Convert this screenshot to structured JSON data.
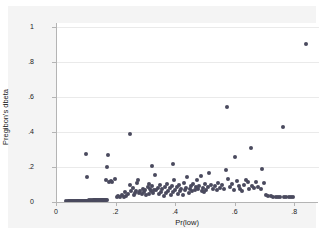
{
  "figure": {
    "background_color": "#f4f4f4",
    "plot_background_color": "#ffffff",
    "marker_color": "#4a4a5e",
    "axis_color": "#b4b4b4",
    "grid_color": "#eaeaea"
  },
  "chart_data": {
    "type": "scatter",
    "title": "",
    "xlabel": "Pr(low)",
    "ylabel": "Pregibon's dbeta",
    "xlim": [
      0,
      0.88
    ],
    "ylim": [
      0,
      1.02
    ],
    "xticks": [
      0,
      0.2,
      0.4,
      0.6,
      0.8
    ],
    "xticklabels": [
      "0",
      ".2",
      ".4",
      ".6",
      ".8"
    ],
    "yticks": [
      0,
      0.2,
      0.4,
      0.6,
      0.8,
      1
    ],
    "yticklabels": [
      "0",
      ".2",
      ".4",
      ".6",
      ".8",
      "1"
    ],
    "grid": "horizontal",
    "legend": null,
    "series": [
      {
        "name": "Pregibon's dbeta",
        "marker": "circle",
        "color": "#4a4a5e",
        "points": [
          [
            0.031,
            0.004
          ],
          [
            0.036,
            0.004
          ],
          [
            0.04,
            0.005
          ],
          [
            0.044,
            0.004
          ],
          [
            0.048,
            0.005
          ],
          [
            0.051,
            0.004
          ],
          [
            0.054,
            0.005
          ],
          [
            0.057,
            0.006
          ],
          [
            0.06,
            0.005
          ],
          [
            0.063,
            0.006
          ],
          [
            0.066,
            0.005
          ],
          [
            0.069,
            0.006
          ],
          [
            0.072,
            0.006
          ],
          [
            0.075,
            0.007
          ],
          [
            0.078,
            0.006
          ],
          [
            0.081,
            0.007
          ],
          [
            0.084,
            0.007
          ],
          [
            0.087,
            0.006
          ],
          [
            0.09,
            0.007
          ],
          [
            0.093,
            0.008
          ],
          [
            0.096,
            0.007
          ],
          [
            0.099,
            0.008
          ],
          [
            0.102,
            0.008
          ],
          [
            0.105,
            0.007
          ],
          [
            0.108,
            0.009
          ],
          [
            0.111,
            0.008
          ],
          [
            0.114,
            0.009
          ],
          [
            0.117,
            0.008
          ],
          [
            0.12,
            0.009
          ],
          [
            0.123,
            0.01
          ],
          [
            0.126,
            0.009
          ],
          [
            0.129,
            0.01
          ],
          [
            0.132,
            0.01
          ],
          [
            0.135,
            0.009
          ],
          [
            0.138,
            0.011
          ],
          [
            0.141,
            0.01
          ],
          [
            0.144,
            0.011
          ],
          [
            0.147,
            0.01
          ],
          [
            0.15,
            0.011
          ],
          [
            0.153,
            0.012
          ],
          [
            0.156,
            0.011
          ],
          [
            0.159,
            0.012
          ],
          [
            0.162,
            0.011
          ],
          [
            0.165,
            0.012
          ],
          [
            0.168,
            0.013
          ],
          [
            0.099,
            0.271
          ],
          [
            0.1,
            0.145
          ],
          [
            0.165,
            0.128
          ],
          [
            0.168,
            0.197
          ],
          [
            0.172,
            0.265
          ],
          [
            0.174,
            0.113
          ],
          [
            0.18,
            0.118
          ],
          [
            0.184,
            0.112
          ],
          [
            0.196,
            0.131
          ],
          [
            0.2,
            0.03
          ],
          [
            0.205,
            0.036
          ],
          [
            0.212,
            0.029
          ],
          [
            0.218,
            0.042
          ],
          [
            0.224,
            0.031
          ],
          [
            0.228,
            0.055
          ],
          [
            0.233,
            0.034
          ],
          [
            0.238,
            0.046
          ],
          [
            0.244,
            0.096
          ],
          [
            0.246,
            0.389
          ],
          [
            0.25,
            0.061
          ],
          [
            0.254,
            0.079
          ],
          [
            0.258,
            0.042
          ],
          [
            0.262,
            0.053
          ],
          [
            0.266,
            0.065
          ],
          [
            0.27,
            0.11
          ],
          [
            0.273,
            0.123
          ],
          [
            0.276,
            0.051
          ],
          [
            0.28,
            0.063
          ],
          [
            0.284,
            0.044
          ],
          [
            0.288,
            0.073
          ],
          [
            0.292,
            0.057
          ],
          [
            0.296,
            0.068
          ],
          [
            0.3,
            0.038
          ],
          [
            0.304,
            0.086
          ],
          [
            0.308,
            0.048
          ],
          [
            0.31,
            0.105
          ],
          [
            0.313,
            0.075
          ],
          [
            0.317,
            0.06
          ],
          [
            0.32,
            0.09
          ],
          [
            0.323,
            0.052
          ],
          [
            0.326,
            0.071
          ],
          [
            0.32,
            0.206
          ],
          [
            0.33,
            0.154
          ],
          [
            0.334,
            0.066
          ],
          [
            0.338,
            0.082
          ],
          [
            0.342,
            0.045
          ],
          [
            0.346,
            0.096
          ],
          [
            0.35,
            0.058
          ],
          [
            0.354,
            0.074
          ],
          [
            0.358,
            0.035
          ],
          [
            0.362,
            0.088
          ],
          [
            0.366,
            0.05
          ],
          [
            0.37,
            0.101
          ],
          [
            0.374,
            0.064
          ],
          [
            0.378,
            0.078
          ],
          [
            0.382,
            0.041
          ],
          [
            0.386,
            0.092
          ],
          [
            0.39,
            0.056
          ],
          [
            0.388,
            0.216
          ],
          [
            0.394,
            0.127
          ],
          [
            0.398,
            0.07
          ],
          [
            0.402,
            0.084
          ],
          [
            0.406,
            0.047
          ],
          [
            0.41,
            0.098
          ],
          [
            0.414,
            0.062
          ],
          [
            0.418,
            0.076
          ],
          [
            0.422,
            0.039
          ],
          [
            0.426,
            0.108
          ],
          [
            0.43,
            0.066
          ],
          [
            0.434,
            0.08
          ],
          [
            0.438,
            0.143
          ],
          [
            0.442,
            0.054
          ],
          [
            0.446,
            0.072
          ],
          [
            0.45,
            0.09
          ],
          [
            0.454,
            0.06
          ],
          [
            0.458,
            0.1
          ],
          [
            0.462,
            0.068
          ],
          [
            0.466,
            0.086
          ],
          [
            0.47,
            0.125
          ],
          [
            0.474,
            0.074
          ],
          [
            0.478,
            0.094
          ],
          [
            0.482,
            0.146
          ],
          [
            0.486,
            0.062
          ],
          [
            0.49,
            0.082
          ],
          [
            0.494,
            0.058
          ],
          [
            0.498,
            0.104
          ],
          [
            0.502,
            0.07
          ],
          [
            0.506,
            0.088
          ],
          [
            0.512,
            0.165
          ],
          [
            0.518,
            0.098
          ],
          [
            0.524,
            0.076
          ],
          [
            0.53,
            0.092
          ],
          [
            0.536,
            0.068
          ],
          [
            0.542,
            0.11
          ],
          [
            0.548,
            0.082
          ],
          [
            0.554,
            0.096
          ],
          [
            0.56,
            0.074
          ],
          [
            0.566,
            0.18
          ],
          [
            0.57,
            0.54
          ],
          [
            0.576,
            0.13
          ],
          [
            0.582,
            0.086
          ],
          [
            0.588,
            0.102
          ],
          [
            0.594,
            0.07
          ],
          [
            0.598,
            0.258
          ],
          [
            0.604,
            0.118
          ],
          [
            0.61,
            0.09
          ],
          [
            0.616,
            0.075
          ],
          [
            0.622,
            0.065
          ],
          [
            0.628,
            0.098
          ],
          [
            0.634,
            0.128
          ],
          [
            0.64,
            0.112
          ],
          [
            0.646,
            0.072
          ],
          [
            0.65,
            0.305
          ],
          [
            0.654,
            0.094
          ],
          [
            0.66,
            0.082
          ],
          [
            0.668,
            0.112
          ],
          [
            0.676,
            0.087
          ],
          [
            0.684,
            0.076
          ],
          [
            0.69,
            0.188
          ],
          [
            0.696,
            0.106
          ],
          [
            0.702,
            0.041
          ],
          [
            0.71,
            0.035
          ],
          [
            0.718,
            0.032
          ],
          [
            0.726,
            0.03
          ],
          [
            0.734,
            0.031
          ],
          [
            0.742,
            0.03
          ],
          [
            0.75,
            0.029
          ],
          [
            0.758,
            0.43
          ],
          [
            0.762,
            0.031
          ],
          [
            0.77,
            0.03
          ],
          [
            0.778,
            0.031
          ],
          [
            0.786,
            0.03
          ],
          [
            0.794,
            0.029
          ],
          [
            0.838,
            0.9
          ]
        ]
      }
    ]
  }
}
